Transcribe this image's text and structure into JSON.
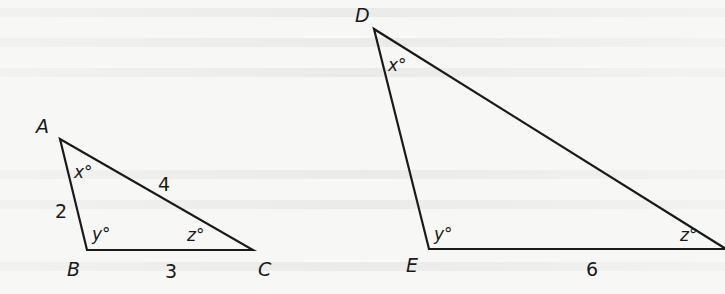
{
  "figure": {
    "triangle_abc": {
      "vertices": {
        "A": "A",
        "B": "B",
        "C": "C"
      },
      "angles": {
        "A": "x°",
        "B": "y°",
        "C": "z°"
      },
      "sides": {
        "AB": "2",
        "AC": "4",
        "BC": "3"
      }
    },
    "triangle_def": {
      "vertices": {
        "D": "D",
        "E": "E"
      },
      "angles": {
        "D": "x°",
        "E": "y°",
        "F": "z°"
      },
      "sides": {
        "EF": "6"
      }
    },
    "stroke_color": "#1a1a1a",
    "background_color": "#f7f7f5"
  }
}
